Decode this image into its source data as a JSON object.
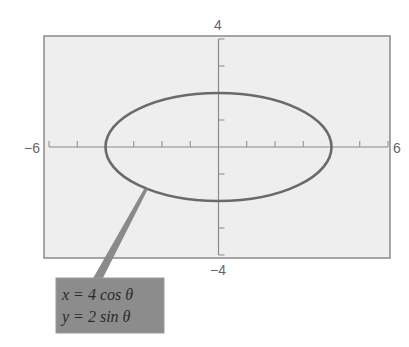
{
  "chart_data": {
    "type": "line",
    "subtype": "parametric",
    "title": "",
    "xlabel": "",
    "ylabel": "",
    "xlim": [
      -6,
      6
    ],
    "ylim": [
      -4,
      4
    ],
    "grid": false,
    "x_tick_step": 1,
    "y_tick_step": 1,
    "axis_labels": {
      "x_min": "−6",
      "x_max": "6",
      "y_min": "−4",
      "y_max": "4"
    },
    "series": [
      {
        "name": "ellipse",
        "equation_x": "x = 4 cos θ",
        "equation_y": "y = 2 sin θ",
        "a": 4,
        "b": 2,
        "center": [
          0,
          0
        ],
        "color": "#6a6a6a"
      }
    ],
    "annotation": {
      "lines": [
        "x = 4 cos θ",
        "y = 2 sin θ"
      ],
      "box_color": "#8c8c8c",
      "anchor_theta_deg": 230
    }
  },
  "colors": {
    "frame_bg": "#eeeeee",
    "frame_border": "#8a8a8a",
    "axis": "#8a8a8a",
    "curve": "#6a6a6a",
    "label_text": "#666666",
    "callout_box": "#8c8c8c",
    "callout_text": "#2a2a2a"
  }
}
